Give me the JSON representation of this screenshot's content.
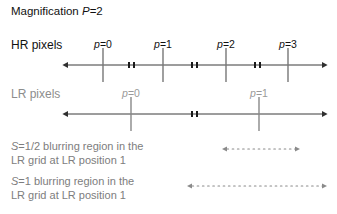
{
  "figure": {
    "title_prefix": "Magnification ",
    "title_symbol": "P",
    "title_value": "=2",
    "background_color": "#ffffff"
  },
  "rows": {
    "hr": {
      "label": "HR pixels",
      "color": "#111111",
      "axis_color": "#3a3a3a",
      "tick_color": "#7a7a7a",
      "axis_y": 65,
      "axis_x_start": 68,
      "axis_x_end": 322,
      "ticks": [
        {
          "label_symbol": "p",
          "label_value": "=0",
          "x": 103
        },
        {
          "label_symbol": "p",
          "label_value": "=1",
          "x": 163
        },
        {
          "label_symbol": "p",
          "label_value": "=2",
          "x": 226
        },
        {
          "label_symbol": "p",
          "label_value": "=3",
          "x": 288
        }
      ],
      "midpoint_markers": [
        131,
        194,
        257
      ]
    },
    "lr": {
      "label": "LR pixels",
      "color": "#8d8d8d",
      "axis_color": "#3a3a3a",
      "tick_color": "#8a8a8a",
      "axis_y": 114,
      "axis_x_start": 68,
      "axis_x_end": 322,
      "ticks": [
        {
          "label_symbol": "p",
          "label_value": "=0",
          "x": 131
        },
        {
          "label_symbol": "p",
          "label_value": "=1",
          "x": 259
        }
      ],
      "midpoint_markers": [
        194
      ]
    }
  },
  "captions": [
    {
      "symbol": "S",
      "text": "=1/2 blurring region in the\nLR grid at LR position 1",
      "color": "#7d7d7d",
      "arrow": {
        "x_start": 227,
        "x_end": 295,
        "y": 149,
        "style": "dotted-double"
      }
    },
    {
      "symbol": "S",
      "text": "=1 blurring region in the\nLR grid at LR position 1",
      "color": "#7d7d7d",
      "arrow": {
        "x_start": 192,
        "x_end": 322,
        "y": 186,
        "style": "dotted-double"
      }
    }
  ]
}
